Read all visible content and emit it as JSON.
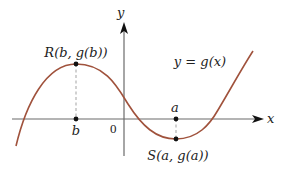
{
  "diagram": {
    "axes": {
      "x_label": "x",
      "y_label": "y",
      "origin_label": "0",
      "axis_color": "#6b6b6b"
    },
    "curve": {
      "label": "y = g(x)",
      "color": "#a0523c",
      "description": "cubic-like curve with local max at R and local min at S"
    },
    "points": {
      "R": {
        "label": "R(b, g(b))",
        "tick_label": "b",
        "type": "local maximum"
      },
      "S": {
        "label": "S(a, g(a))",
        "tick_label": "a",
        "type": "local minimum"
      }
    },
    "guide_line_style": "dashed"
  }
}
